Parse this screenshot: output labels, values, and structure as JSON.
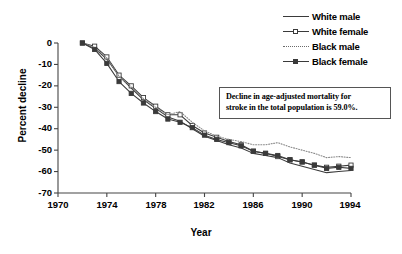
{
  "chart_data": {
    "type": "line",
    "title": "",
    "xlabel": "Year",
    "ylabel": "Percent decline",
    "xlim": [
      1970,
      1994
    ],
    "ylim": [
      -70,
      0
    ],
    "xticks": [
      "1970",
      "1974",
      "1978",
      "1982",
      "1986",
      "1990",
      "1994"
    ],
    "yticks": [
      "0",
      "-10",
      "-20",
      "-30",
      "-40",
      "-50",
      "-60",
      "-70"
    ],
    "grid": false,
    "legend_position": "top-right",
    "x": [
      1972,
      1973,
      1974,
      1975,
      1976,
      1977,
      1978,
      1979,
      1980,
      1981,
      1982,
      1983,
      1984,
      1985,
      1986,
      1987,
      1988,
      1989,
      1990,
      1991,
      1992,
      1993,
      1994
    ],
    "series": [
      {
        "name": "White male",
        "marker": "none",
        "line_style": "solid",
        "color": "#3a3a3a",
        "values": [
          0,
          -2.5,
          -7.5,
          -15.5,
          -21.0,
          -26.5,
          -30.5,
          -34.5,
          -36.5,
          -40.0,
          -43.5,
          -45.5,
          -47.5,
          -49.0,
          -51.5,
          -52.5,
          -53.5,
          -56.0,
          -57.5,
          -59.0,
          -60.5,
          -60.0,
          -59.5
        ]
      },
      {
        "name": "White female",
        "marker": "open-square",
        "line_style": "solid",
        "color": "#3a3a3a",
        "values": [
          0,
          -1.5,
          -6.5,
          -15.0,
          -20.0,
          -25.5,
          -29.5,
          -33.5,
          -33.5,
          -38.5,
          -42.0,
          -44.0,
          -46.0,
          -47.5,
          -50.5,
          -51.5,
          -53.0,
          -54.5,
          -55.5,
          -57.0,
          -58.0,
          -57.5,
          -57.0
        ]
      },
      {
        "name": "Black male",
        "marker": "none",
        "line_style": "dotted",
        "color": "#8a8a8a",
        "values": [
          0,
          -2.0,
          -7.0,
          -15.5,
          -20.5,
          -26.0,
          -30.0,
          -33.5,
          -32.0,
          -37.0,
          -41.0,
          -43.5,
          -45.0,
          -46.0,
          -47.5,
          -47.5,
          -46.5,
          -48.5,
          -50.0,
          -51.5,
          -53.5,
          -53.0,
          -53.5
        ]
      },
      {
        "name": "Black female",
        "marker": "filled-square",
        "line_style": "solid",
        "color": "#3a3a3a",
        "values": [
          0,
          -3.0,
          -9.5,
          -18.0,
          -23.5,
          -28.0,
          -32.0,
          -35.5,
          -37.0,
          -39.5,
          -43.0,
          -45.0,
          -46.5,
          -48.0,
          -50.5,
          -51.5,
          -52.5,
          -54.5,
          -55.5,
          -57.0,
          -58.5,
          -58.0,
          -58.5
        ]
      }
    ],
    "annotation": {
      "line1": "Decline in age-adjusted mortality for",
      "line2": "stroke in the total population is 59.0%."
    }
  },
  "legend": {
    "items": [
      {
        "label": "White male"
      },
      {
        "label": "White female"
      },
      {
        "label": "Black male"
      },
      {
        "label": "Black female"
      }
    ]
  }
}
